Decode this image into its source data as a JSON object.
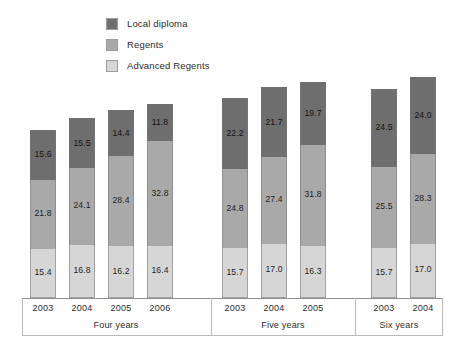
{
  "legend": {
    "items": [
      {
        "label": "Local diploma",
        "key": "local",
        "color": "#6e6e6e"
      },
      {
        "label": "Regents",
        "key": "regents",
        "color": "#a9a9a9"
      },
      {
        "label": "Advanced Regents",
        "key": "advanced",
        "color": "#d6d6d6"
      }
    ]
  },
  "chart_data": {
    "type": "bar",
    "subtype": "stacked-bar-grouped",
    "title": "",
    "subtitle": "",
    "xlabel": "",
    "ylabel": "",
    "grid": false,
    "legend_position": "top-left",
    "ylim": [
      0,
      68
    ],
    "categories": [
      "2003",
      "2004",
      "2005",
      "2006",
      "2003",
      "2004",
      "2005",
      "2003",
      "2004"
    ],
    "series": [
      {
        "name": "Local diploma",
        "values": [
          15.6,
          15.5,
          14.4,
          11.8,
          22.2,
          21.7,
          19.7,
          24.5,
          24.0
        ]
      },
      {
        "name": "Regents",
        "values": [
          21.8,
          24.1,
          28.4,
          32.8,
          24.8,
          27.4,
          31.8,
          25.5,
          28.3
        ]
      },
      {
        "name": "Advanced Regents",
        "values": [
          15.4,
          16.8,
          16.2,
          16.4,
          15.7,
          17.0,
          16.3,
          15.7,
          17.0
        ]
      }
    ],
    "groups": [
      {
        "label": "Four years",
        "bars": [
          {
            "year": "2003",
            "local": "15.6",
            "regents": "21.8",
            "advanced": "15.4",
            "total": 52.8
          },
          {
            "year": "2004",
            "local": "15.5",
            "regents": "24.1",
            "advanced": "16.8",
            "total": 56.4
          },
          {
            "year": "2005",
            "local": "14.4",
            "regents": "28.4",
            "advanced": "16.2",
            "total": 59.0
          },
          {
            "year": "2006",
            "local": "11.8",
            "regents": "32.8",
            "advanced": "16.4",
            "total": 61.0
          }
        ]
      },
      {
        "label": "Five years",
        "bars": [
          {
            "year": "2003",
            "local": "22.2",
            "regents": "24.8",
            "advanced": "15.7",
            "total": 62.7
          },
          {
            "year": "2004",
            "local": "21.7",
            "regents": "27.4",
            "advanced": "17.0",
            "total": 66.1
          },
          {
            "year": "2005",
            "local": "19.7",
            "regents": "31.8",
            "advanced": "16.3",
            "total": 67.8
          }
        ]
      },
      {
        "label": "Six years",
        "bars": [
          {
            "year": "2003",
            "local": "24.5",
            "regents": "25.5",
            "advanced": "15.7",
            "total": 65.7
          },
          {
            "year": "2004",
            "local": "24.0",
            "regents": "28.3",
            "advanced": "17.0",
            "total": 69.3
          }
        ]
      }
    ]
  },
  "layout": {
    "bar_x": [
      30,
      69,
      108,
      147,
      222,
      261,
      300,
      371,
      410
    ],
    "group_sep_x": [
      211,
      355
    ],
    "group_label_center": [
      116,
      283,
      399
    ],
    "px_per_unit": 3.185
  }
}
